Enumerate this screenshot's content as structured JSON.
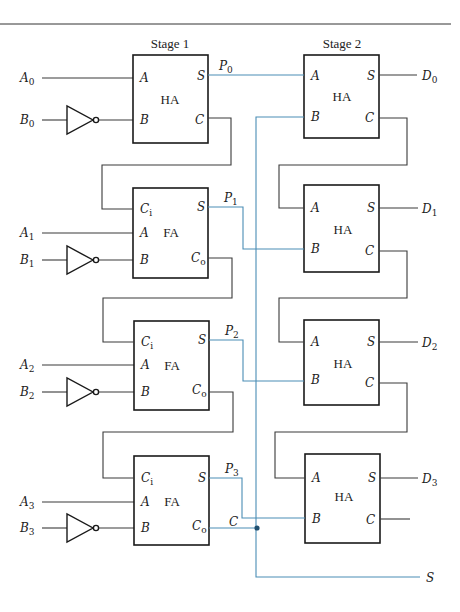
{
  "colors": {
    "wire": "#3a3a3a",
    "highlight_wire": "#4a8db5",
    "box": "#1a1a1a"
  },
  "headers": {
    "stage1": "Stage 1",
    "stage2": "Stage 2"
  },
  "stage1": [
    {
      "type": "HA",
      "inputs": [
        "A",
        "B"
      ],
      "outputs": [
        "S",
        "C"
      ],
      "a_label": "A",
      "a_sub": "0",
      "b_label": "B",
      "b_sub": "0",
      "sum_label": "P",
      "sum_sub": "0"
    },
    {
      "type": "FA",
      "inputs": [
        "Ci",
        "A",
        "B"
      ],
      "outputs": [
        "S",
        "Co"
      ],
      "a_label": "A",
      "a_sub": "1",
      "b_label": "B",
      "b_sub": "1",
      "sum_label": "P",
      "sum_sub": "1"
    },
    {
      "type": "FA",
      "inputs": [
        "Ci",
        "A",
        "B"
      ],
      "outputs": [
        "S",
        "Co"
      ],
      "a_label": "A",
      "a_sub": "2",
      "b_label": "B",
      "b_sub": "2",
      "sum_label": "P",
      "sum_sub": "2"
    },
    {
      "type": "FA",
      "inputs": [
        "Ci",
        "A",
        "B"
      ],
      "outputs": [
        "S",
        "Co"
      ],
      "a_label": "A",
      "a_sub": "3",
      "b_label": "B",
      "b_sub": "3",
      "sum_label": "P",
      "sum_sub": "3",
      "carry_label": "C"
    }
  ],
  "stage2": [
    {
      "type": "HA",
      "out_label": "D",
      "out_sub": "0"
    },
    {
      "type": "HA",
      "out_label": "D",
      "out_sub": "1"
    },
    {
      "type": "HA",
      "out_label": "D",
      "out_sub": "2"
    },
    {
      "type": "HA",
      "out_label": "D",
      "out_sub": "3"
    }
  ],
  "pins": {
    "A": "A",
    "B": "B",
    "S": "S",
    "C": "C",
    "Ci_main": "C",
    "Ci_sub": "i",
    "Co_main": "C",
    "Co_sub": "o",
    "HA": "HA",
    "FA": "FA"
  },
  "final_output": "S"
}
